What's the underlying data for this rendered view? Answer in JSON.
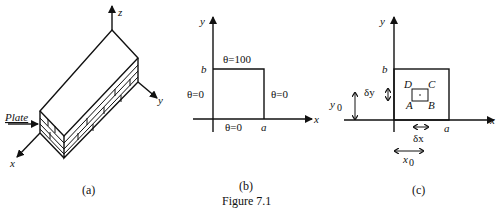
{
  "figure": {
    "caption": "Figure 7.1",
    "panels": [
      {
        "id": "a",
        "label": "(a)",
        "description": "Stack of plates in 3D",
        "axes": {
          "x": "x",
          "y": "y",
          "z": "z"
        },
        "annotation": "Plate"
      },
      {
        "id": "b",
        "label": "(b)",
        "description": "Boundary conditions on rectangular plate",
        "axes": {
          "x": "x",
          "y": "y"
        },
        "corner_labels": {
          "a": "a",
          "b": "b"
        },
        "boundary_conditions": {
          "top": "θ=100",
          "left": "θ=0",
          "right": "θ=0",
          "bottom": "θ=0"
        }
      },
      {
        "id": "c",
        "label": "(c)",
        "description": "Small element ABCD within plate",
        "axes": {
          "x": "x",
          "y": "y"
        },
        "corner_labels": {
          "a": "a",
          "b": "b"
        },
        "element_vertices": {
          "A": "A",
          "B": "B",
          "C": "C",
          "D": "D"
        },
        "dimensions": {
          "dx": "δx",
          "dy": "δy",
          "x0": "x",
          "x0_sub": "0",
          "y0": "y",
          "y0_sub": "0"
        }
      }
    ]
  }
}
